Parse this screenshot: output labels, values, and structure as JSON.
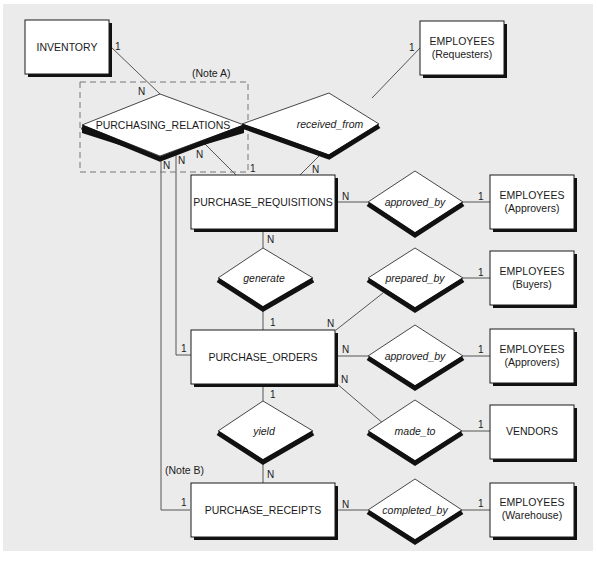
{
  "diagram": {
    "type": "entity-relationship",
    "colors": {
      "background": "#ebebeb",
      "entity_fill": "#ffffff",
      "stroke": "#1a1a1a",
      "line": "#555555",
      "shadow": "#111111",
      "note_box": "#777777"
    },
    "notes": {
      "note_a": "(Note A)",
      "note_b": "(Note B)"
    },
    "entities": {
      "inventory": "INVENTORY",
      "employees_requesters": {
        "line1": "EMPLOYEES",
        "line2": "(Requesters)"
      },
      "purchase_requisitions": "PURCHASE_REQUISITIONS",
      "employees_approvers_req": {
        "line1": "EMPLOYEES",
        "line2": "(Approvers)"
      },
      "employees_buyers": {
        "line1": "EMPLOYEES",
        "line2": "(Buyers)"
      },
      "purchase_orders": "PURCHASE_ORDERS",
      "employees_approvers_po": {
        "line1": "EMPLOYEES",
        "line2": "(Approvers)"
      },
      "vendors": "VENDORS",
      "purchase_receipts": "PURCHASE_RECEIPTS",
      "employees_warehouse": {
        "line1": "EMPLOYEES",
        "line2": "(Warehouse)"
      }
    },
    "relationships": {
      "purchasing_relations": "PURCHASING_RELATIONS",
      "received_from": "received_from",
      "approved_by_req": "approved_by",
      "generate": "generate",
      "prepared_by": "prepared_by",
      "approved_by_po": "approved_by",
      "yield": "yield",
      "made_to": "made_to",
      "completed_by": "completed_by"
    },
    "cardinalities": {
      "inventory_pr": "1",
      "pr_inventory": "N",
      "pr_req_top": "N",
      "pr_req_po": "N",
      "pr_req_rec": "N",
      "req_pr": "1",
      "req_received": "N",
      "requesters_received": "1",
      "req_approved": "N",
      "approvers_req": "1",
      "req_generate": "N",
      "po_generate": "1",
      "po_prepared": "N",
      "buyers_prepared": "1",
      "po_approved": "N",
      "approvers_po": "1",
      "po_made_to": "N",
      "vendors_made_to": "1",
      "po_pr": "1",
      "po_yield": "1",
      "rec_yield": "N",
      "rec_pr": "1",
      "rec_completed": "N",
      "warehouse_completed": "1"
    }
  }
}
